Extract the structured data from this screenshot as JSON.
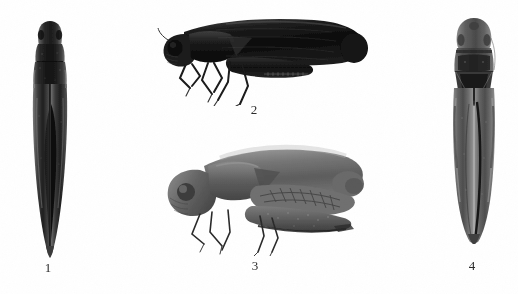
{
  "plate": {
    "width": 518,
    "height": 294,
    "background_color": "#ffffff",
    "medium": "black-and-white halftone photographic plate",
    "subject": "leafhopper specimens"
  },
  "figures": [
    {
      "label": "1",
      "view": "dorsal",
      "orientation": "vertical, head up",
      "tone": "very dark, near-black with grey highlights",
      "label_x": 46,
      "label_y": 264,
      "body_x": 31,
      "body_y": 21,
      "body_w": 36,
      "body_h": 232,
      "tone_hex": "#1e1e1e"
    },
    {
      "label": "2",
      "view": "lateral",
      "orientation": "horizontal, head left",
      "tone": "very dark, near-black silhouette with legs",
      "label_x": 252,
      "label_y": 106,
      "body_x": 158,
      "body_y": 10,
      "body_w": 210,
      "body_h": 90,
      "tone_hex": "#141414"
    },
    {
      "label": "3",
      "view": "lateral",
      "orientation": "horizontal, head left",
      "tone": "medium grey with visible wing venation",
      "label_x": 253,
      "label_y": 262,
      "body_x": 163,
      "body_y": 142,
      "body_w": 205,
      "body_h": 112,
      "tone_hex": "#6d6d6d"
    },
    {
      "label": "4",
      "view": "dorsal",
      "orientation": "vertical, head up",
      "tone": "mid-to-dark grey with dark pronotal band",
      "label_x": 470,
      "label_y": 262,
      "body_x": 450,
      "body_y": 16,
      "body_w": 46,
      "body_h": 224,
      "tone_hex": "#555555"
    }
  ]
}
